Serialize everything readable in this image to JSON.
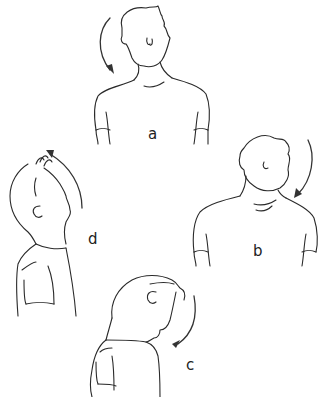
{
  "illustration": {
    "subject": "neck stretch exercises",
    "line_color": "#2a2a2a",
    "background": "#ffffff",
    "panels": [
      {
        "id": "a",
        "label": "a",
        "description": "head tilted toward left shoulder",
        "arrow": "clockwise-down-left"
      },
      {
        "id": "b",
        "label": "b",
        "description": "head tilted toward right shoulder",
        "arrow": "down-right"
      },
      {
        "id": "c",
        "label": "c",
        "description": "head bowed forward, chin to chest",
        "arrow": "down-forward"
      },
      {
        "id": "d",
        "label": "d",
        "description": "head tilted back, looking up",
        "arrow": "up-back"
      }
    ]
  }
}
